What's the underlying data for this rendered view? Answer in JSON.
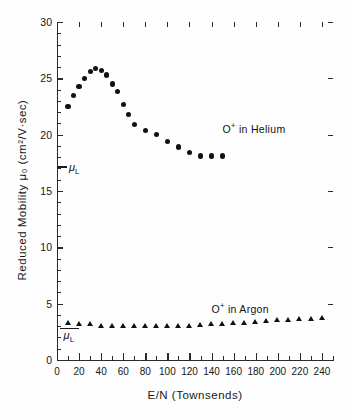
{
  "chart_data": {
    "type": "scatter",
    "title": "",
    "xlabel": "E/N  (Townsends)",
    "ylabel": "Reduced Mobility  μ₀  (cm²/V·sec)",
    "xlim": [
      0,
      250
    ],
    "ylim": [
      0,
      30
    ],
    "grid": false,
    "legend_position": "inline-annotation",
    "x_major_step": 20,
    "x_minor_step": 10,
    "y_major_step": 5,
    "y_minor_step": 1,
    "xticks": [
      0,
      20,
      40,
      60,
      80,
      100,
      120,
      140,
      160,
      180,
      200,
      220,
      240
    ],
    "xtick_labels": [
      "0",
      "20",
      "40",
      "60",
      "80",
      "100",
      "120",
      "140",
      "160",
      "180",
      "200",
      "220",
      "240"
    ],
    "yticks": [
      0,
      5,
      10,
      15,
      20,
      25,
      30
    ],
    "ytick_labels": [
      "0",
      "5",
      "10",
      "15",
      "20",
      "25",
      "30"
    ],
    "series": [
      {
        "name": "O⁺ in Helium",
        "marker": "filled-circle",
        "color": "#111111",
        "annotation": "O+ in  Helium",
        "annotation_x": 150,
        "annotation_y": 20.6,
        "x": [
          10,
          15,
          20,
          25,
          30,
          35,
          40,
          45,
          50,
          55,
          60,
          65,
          70,
          80,
          90,
          100,
          110,
          120,
          130,
          140,
          150
        ],
        "y": [
          22.5,
          23.5,
          24.3,
          25.0,
          25.6,
          25.9,
          25.7,
          25.3,
          24.5,
          23.8,
          22.7,
          21.8,
          20.9,
          20.4,
          20.0,
          19.4,
          18.9,
          18.4,
          18.1,
          18.1,
          18.1
        ]
      },
      {
        "name": "O⁺ in Argon",
        "marker": "filled-triangle",
        "color": "#111111",
        "annotation": "O+ in  Argon",
        "annotation_x": 140,
        "annotation_y": 4.6,
        "x": [
          10,
          20,
          30,
          40,
          50,
          60,
          70,
          80,
          90,
          100,
          110,
          120,
          130,
          140,
          150,
          160,
          170,
          180,
          190,
          200,
          210,
          220,
          230,
          240
        ],
        "y": [
          3.3,
          3.2,
          3.15,
          3.05,
          3.0,
          3.0,
          2.98,
          2.98,
          3.0,
          3.0,
          3.02,
          3.05,
          3.1,
          3.15,
          3.2,
          3.25,
          3.3,
          3.35,
          3.45,
          3.5,
          3.55,
          3.6,
          3.65,
          3.7
        ]
      }
    ],
    "reference_markers": [
      {
        "name": "mu_L_helium",
        "label": "μ",
        "subscript": "L",
        "y": 17.2,
        "x_start": 0,
        "x_end": 9
      },
      {
        "name": "mu_L_argon",
        "label": "μ",
        "subscript": "L",
        "y": 2.85,
        "x_start": 3,
        "x_end": 20
      }
    ]
  },
  "figure": {
    "background": "#fefefe",
    "ink_color": "#111111",
    "axis_color": "#2b2b2b"
  },
  "annotations": {
    "helium_prefix": "O",
    "helium_sup": "+",
    "helium_suffix": " in  Helium",
    "argon_prefix": "O",
    "argon_sup": "+",
    "argon_suffix": " in  Argon"
  }
}
